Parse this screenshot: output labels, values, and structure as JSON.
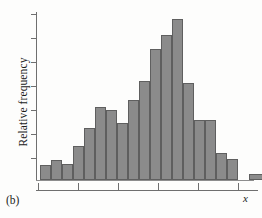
{
  "figure": {
    "caption": "(b)",
    "ylabel": "Relative frequency",
    "xvar": "x"
  },
  "colors": {
    "bar_fill": "#8b8b8b",
    "bar_stroke": "#5f5f5f",
    "axis": "#6f6f6f",
    "background": "#fdfdfc",
    "text": "#1b1b1b"
  },
  "chart_data": {
    "type": "bar",
    "title": "",
    "xlabel": "x",
    "ylabel": "Relative frequency",
    "subtitle": "",
    "grid": false,
    "legend": null,
    "axis_tick_labels": {
      "x": [],
      "y": []
    },
    "y_tick_count": 7,
    "x_tick_count": 6,
    "ylim": [
      0,
      1.0
    ],
    "note": "Unlabeled relative-frequency histogram; bar heights read as fractions of the plot height. Bins are contiguous with one isolated outlier bin at the far right.",
    "categories": [
      "b1",
      "b2",
      "b3",
      "b4",
      "b5",
      "b6",
      "b7",
      "b8",
      "b9",
      "b10",
      "b11",
      "b12",
      "b13",
      "b14",
      "b15",
      "b16",
      "b17",
      "b18"
    ],
    "values": [
      0.085,
      0.115,
      0.09,
      0.195,
      0.3,
      0.42,
      0.405,
      0.33,
      0.46,
      0.57,
      0.76,
      0.84,
      0.935,
      0.56,
      0.345,
      0.345,
      0.155,
      0.12
    ],
    "outlier_bin": {
      "label": "b20",
      "value": 0.035
    }
  },
  "bars": [
    {
      "name": "bin-1",
      "left": 4,
      "width": 11,
      "height": 15
    },
    {
      "name": "bin-2",
      "left": 15,
      "width": 11,
      "height": 20
    },
    {
      "name": "bin-3",
      "left": 26,
      "width": 11,
      "height": 16
    },
    {
      "name": "bin-4",
      "left": 37,
      "width": 11,
      "height": 34
    },
    {
      "name": "bin-5",
      "left": 48,
      "width": 11,
      "height": 52
    },
    {
      "name": "bin-6",
      "left": 59,
      "width": 11,
      "height": 73
    },
    {
      "name": "bin-7",
      "left": 70,
      "width": 11,
      "height": 70
    },
    {
      "name": "bin-8",
      "left": 81,
      "width": 11,
      "height": 57
    },
    {
      "name": "bin-9",
      "left": 92,
      "width": 11,
      "height": 80
    },
    {
      "name": "bin-10",
      "left": 103,
      "width": 11,
      "height": 99
    },
    {
      "name": "bin-11",
      "left": 114,
      "width": 11,
      "height": 131
    },
    {
      "name": "bin-12",
      "left": 125,
      "width": 11,
      "height": 145
    },
    {
      "name": "bin-13",
      "left": 136,
      "width": 11,
      "height": 161
    },
    {
      "name": "bin-14",
      "left": 147,
      "width": 11,
      "height": 97
    },
    {
      "name": "bin-15",
      "left": 158,
      "width": 11,
      "height": 60
    },
    {
      "name": "bin-16",
      "left": 169,
      "width": 11,
      "height": 60
    },
    {
      "name": "bin-17",
      "left": 180,
      "width": 11,
      "height": 27
    },
    {
      "name": "bin-18",
      "left": 191,
      "width": 11,
      "height": 21
    },
    {
      "name": "bin-outlier",
      "left": 213,
      "width": 14,
      "height": 6
    }
  ],
  "y_ticks": [
    4,
    28,
    52,
    76,
    100,
    124,
    148
  ],
  "x_ticks": [
    2,
    42,
    82,
    122,
    162,
    202
  ]
}
